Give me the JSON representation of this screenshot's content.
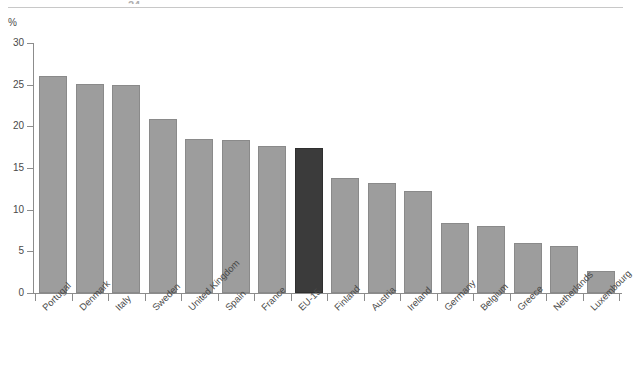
{
  "header": {
    "cropped_text": "24"
  },
  "axis": {
    "unit_label": "%",
    "y_ticks": [
      "0",
      "5",
      "10",
      "15",
      "20",
      "25",
      "30"
    ]
  },
  "chart_data": {
    "type": "bar",
    "title": "",
    "subtitle": "",
    "xlabel": "",
    "ylabel": "%",
    "ylim": [
      0,
      30
    ],
    "ytick_values": [
      0,
      5,
      10,
      15,
      20,
      25,
      30
    ],
    "grid": false,
    "legend": "none",
    "highlight_category": "EU-15",
    "colors": {
      "bar": "#9d9d9d",
      "bar_border": "#8a8a8a",
      "highlight_bar": "#3b3b3b",
      "highlight_border": "#2f2f2f",
      "axis": "#8c8c8c",
      "text": "#4a4a4a",
      "background": "#ffffff"
    },
    "categories": [
      "Portugal",
      "Denmark",
      "Italy",
      "Sweden",
      "United Kingdom",
      "Spain",
      "France",
      "EU-15",
      "Finland",
      "Austria",
      "Ireland",
      "Germany",
      "Belgium",
      "Greece",
      "Netherlands",
      "Luxembourg"
    ],
    "values": [
      26.0,
      25.1,
      25.0,
      20.9,
      18.5,
      18.4,
      17.6,
      17.4,
      13.8,
      13.2,
      12.3,
      8.4,
      8.0,
      6.0,
      5.7,
      2.7
    ]
  }
}
